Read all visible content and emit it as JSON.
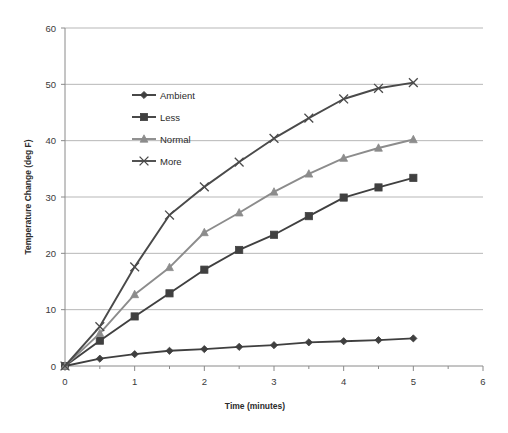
{
  "chart_data": {
    "type": "line",
    "title": "",
    "xlabel": "Time (minutes)",
    "ylabel": "Temperature Change (deg F)",
    "xlim": [
      0,
      6
    ],
    "ylim": [
      0,
      60
    ],
    "xticks": [
      0,
      1,
      2,
      3,
      4,
      5,
      6
    ],
    "yticks": [
      0,
      10,
      20,
      30,
      40,
      50,
      60
    ],
    "xtick_labels": [
      "0",
      "1",
      "2",
      "3",
      "4",
      "5",
      "6"
    ],
    "ytick_labels": [
      "0",
      "10",
      "20",
      "30",
      "40",
      "50",
      "60"
    ],
    "grid": "horizontal",
    "legend_position": "upper-left-inside",
    "x": [
      0,
      0.5,
      1,
      1.5,
      2,
      2.5,
      3,
      3.5,
      4,
      4.5,
      5
    ],
    "series": [
      {
        "name": "Ambient",
        "marker": "diamond",
        "color": "#3f3f3f",
        "values": [
          0,
          1.3,
          2.1,
          2.7,
          3.0,
          3.4,
          3.7,
          4.2,
          4.4,
          4.6,
          4.9
        ]
      },
      {
        "name": "Less",
        "marker": "square",
        "color": "#404040",
        "values": [
          0,
          4.5,
          8.8,
          12.9,
          17.1,
          20.6,
          23.3,
          26.6,
          29.9,
          31.7,
          33.4
        ]
      },
      {
        "name": "Normal",
        "marker": "triangle",
        "color": "#8c8c8c",
        "values": [
          0,
          5.8,
          12.7,
          17.5,
          23.7,
          27.2,
          30.9,
          34.1,
          36.9,
          38.7,
          40.2
        ]
      },
      {
        "name": "More",
        "marker": "cross",
        "color": "#4a4a4a",
        "values": [
          0,
          7.0,
          17.6,
          26.8,
          31.8,
          36.2,
          40.4,
          44.0,
          47.4,
          49.3,
          50.3
        ]
      }
    ]
  },
  "axes": {
    "y_axis_title": "Temperature Change (deg F)",
    "x_axis_title": "Time (minutes)"
  },
  "legend": {
    "items": [
      {
        "label": "Ambient"
      },
      {
        "label": "Less"
      },
      {
        "label": "Normal"
      },
      {
        "label": "More"
      }
    ]
  },
  "style": {
    "grid_color": "#b7b7b7",
    "axis_color": "#8a8a8a",
    "background": "#ffffff"
  }
}
